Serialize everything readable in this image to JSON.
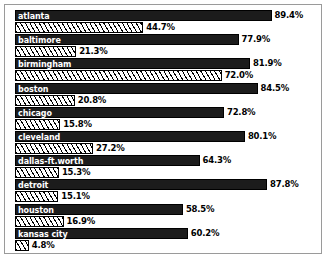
{
  "chart_data": {
    "type": "bar",
    "title": "",
    "subtitle": "",
    "xlabel": "",
    "ylabel": "",
    "orientation": "horizontal",
    "grid": false,
    "legend_position": "none",
    "xlim": [
      0,
      100
    ],
    "value_suffix": "%",
    "categories": [
      "atlanta",
      "baltimore",
      "birmingham",
      "boston",
      "chicago",
      "cleveland",
      "dallas-ft.worth",
      "detroit",
      "houston",
      "kansas city"
    ],
    "series": [
      {
        "name": "series-1",
        "style": "solid",
        "values": [
          89.4,
          77.9,
          81.9,
          84.5,
          72.8,
          80.1,
          64.3,
          87.8,
          58.5,
          60.2
        ]
      },
      {
        "name": "series-2",
        "style": "hatched",
        "values": [
          44.7,
          21.3,
          72.0,
          20.8,
          15.8,
          27.2,
          15.3,
          15.1,
          16.9,
          4.8
        ]
      }
    ],
    "value_labels": {
      "series-1": [
        "89.4%",
        "77.9%",
        "81.9%",
        "84.5%",
        "72.8%",
        "80.1%",
        "64.3%",
        "87.8%",
        "58.5%",
        "60.2%"
      ],
      "series-2": [
        "44.7%",
        "21.3%",
        "72.0%",
        "20.8%",
        "15.8%",
        "27.2%",
        "15.3%",
        "15.1%",
        "16.9%",
        "4.8%"
      ]
    },
    "colors": {
      "solid_bar": "#1c1c1c",
      "hatch_bar_bg": "#ffffff",
      "hatch_bar_line": "#000000",
      "bar_outline": "#000000",
      "category_label": "#ffffff",
      "value_label": "#000000",
      "frame_border": "#9a9a9a",
      "background": "#ffffff"
    }
  },
  "rows": [
    {
      "category": "atlanta",
      "solid_value": "89.4%",
      "hatch_value": "44.7%"
    },
    {
      "category": "baltimore",
      "solid_value": "77.9%",
      "hatch_value": "21.3%"
    },
    {
      "category": "birmingham",
      "solid_value": "81.9%",
      "hatch_value": "72.0%"
    },
    {
      "category": "boston",
      "solid_value": "84.5%",
      "hatch_value": "20.8%"
    },
    {
      "category": "chicago",
      "solid_value": "72.8%",
      "hatch_value": "15.8%"
    },
    {
      "category": "cleveland",
      "solid_value": "80.1%",
      "hatch_value": "27.2%"
    },
    {
      "category": "dallas-ft.worth",
      "solid_value": "64.3%",
      "hatch_value": "15.3%"
    },
    {
      "category": "detroit",
      "solid_value": "87.8%",
      "hatch_value": "15.1%"
    },
    {
      "category": "houston",
      "solid_value": "58.5%",
      "hatch_value": "16.9%"
    },
    {
      "category": "kansas city",
      "solid_value": "60.2%",
      "hatch_value": "4.8%"
    }
  ]
}
